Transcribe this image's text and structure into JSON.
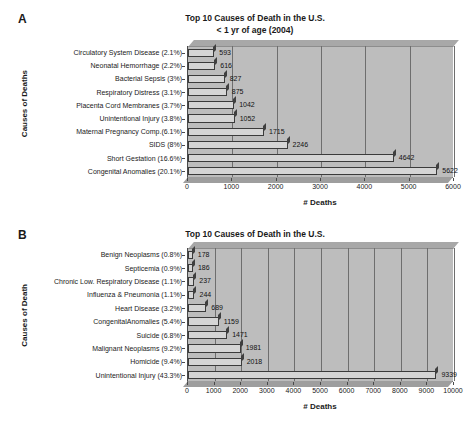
{
  "figure": {
    "panels": [
      {
        "letter": "A",
        "title_line1": "Top 10 Causes of Death in the U.S.",
        "title_line2": "< 1 yr of age (2004)",
        "ylabel": "Causes of Deaths",
        "xlabel": "# Deaths"
      },
      {
        "letter": "B",
        "title_line1": "Top 10 Causes of Death in the U.S.",
        "title_line2": "1-18 yrs of age (2004)",
        "ylabel": "Causes of Death",
        "xlabel": "# Deaths"
      }
    ]
  },
  "chart_data": [
    {
      "type": "bar",
      "orientation": "horizontal",
      "title": "Top 10 Causes of Death in the U.S. < 1 yr of age (2004)",
      "xlabel": "# Deaths",
      "ylabel": "Causes of Deaths",
      "xlim": [
        0,
        6000
      ],
      "xticks": [
        0,
        1000,
        2000,
        3000,
        4000,
        5000,
        6000
      ],
      "xtick_labels": [
        "0",
        "1000",
        "2000",
        "3000",
        "4000",
        "5000",
        "6000"
      ],
      "grid": true,
      "legend": null,
      "categories": [
        "Circulatory System Disease (2.1%)",
        "Neonatal Hemorrhage (2.2%)",
        "Bacterial Sepsis (3%)",
        "Respiratory Distress (3.1%)",
        "Placenta Cord Membranes (3.7%)",
        "Unintentional Injury (3.8%)",
        "Maternal Pregnancy Comp.(6.1%)",
        "SIDS (8%)",
        "Short Gestation (16.6%)",
        "Congenital Anomalies (20.1%)"
      ],
      "values": [
        593,
        616,
        827,
        875,
        1042,
        1052,
        1715,
        2246,
        4642,
        5622
      ],
      "value_labels": [
        "593",
        "616",
        "827",
        "875",
        "1042",
        "1052",
        "1715",
        "2246",
        "4642",
        "5622"
      ],
      "percents": [
        2.1,
        2.2,
        3.0,
        3.1,
        3.7,
        3.8,
        6.1,
        8.0,
        16.6,
        20.1
      ]
    },
    {
      "type": "bar",
      "orientation": "horizontal",
      "title": "Top 10 Causes of Death in the U.S. 1-18 yrs of age (2004)",
      "xlabel": "# Deaths",
      "ylabel": "Causes of Death",
      "xlim": [
        0,
        10000
      ],
      "xticks": [
        0,
        1000,
        2000,
        3000,
        4000,
        5000,
        6000,
        7000,
        8000,
        9000,
        10000
      ],
      "xtick_labels": [
        "0",
        "1000",
        "2000",
        "3000",
        "4000",
        "5000",
        "6000",
        "7000",
        "8000",
        "9000",
        "10000"
      ],
      "grid": true,
      "legend": null,
      "categories": [
        "Benign Neoplasms (0.8%)",
        "Septicemia (0.9%)",
        "Chronic Low. Respiratory Disease (1.1%)",
        "Influenza & Pneumonia (1.1%)",
        "Heart Disease (3.2%)",
        "CongenitalAnomalies (5.4%)",
        "Suicide (6.8%)",
        "Malignant Neoplasms (9.2%)",
        "Homicide (9.4%)",
        "Unintentional Injury (43.3%)"
      ],
      "values": [
        178,
        186,
        237,
        244,
        689,
        1159,
        1471,
        1981,
        2018,
        9339
      ],
      "value_labels": [
        "178",
        "186",
        "237",
        "244",
        "689",
        "1159",
        "1471",
        "1981",
        "2018",
        "9339"
      ],
      "percents": [
        0.8,
        0.9,
        1.1,
        1.1,
        3.2,
        5.4,
        6.8,
        9.2,
        9.4,
        43.3
      ]
    }
  ]
}
